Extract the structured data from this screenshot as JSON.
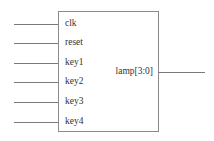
{
  "diagram": {
    "type": "block-symbol",
    "inputs": [
      {
        "name": "clk",
        "y": 24
      },
      {
        "name": "reset",
        "y": 43
      },
      {
        "name": "key1",
        "y": 63
      },
      {
        "name": "key2",
        "y": 82
      },
      {
        "name": "key3",
        "y": 102
      },
      {
        "name": "key4",
        "y": 122
      }
    ],
    "outputs": [
      {
        "name": "lamp[3:0]",
        "y": 72
      }
    ],
    "colors": {
      "line": "#7a7a7a",
      "text": "#333333",
      "background": "#ffffff"
    }
  }
}
